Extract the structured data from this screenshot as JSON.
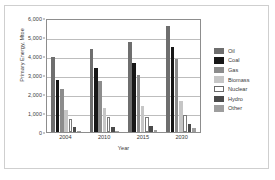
{
  "chart_data": {
    "type": "bar",
    "title": "",
    "xlabel": "Year",
    "ylabel": "Primary Energy, Mtoe",
    "categories": [
      "2004",
      "2010",
      "2015",
      "2030"
    ],
    "ylim": [
      0,
      6000
    ],
    "yticks": [
      0,
      1000,
      2000,
      3000,
      4000,
      5000,
      6000
    ],
    "ytick_labels": [
      "0",
      "1,000",
      "2,000",
      "3,000",
      "4,000",
      "5,000",
      "6,000"
    ],
    "grid": true,
    "legend_position": "right",
    "series": [
      {
        "name": "Oil",
        "color": "#6e6e6e",
        "values": [
          3950,
          4380,
          4750,
          5600
        ]
      },
      {
        "name": "Coal",
        "color": "#171717",
        "values": [
          2750,
          3350,
          3650,
          4450
        ]
      },
      {
        "name": "Gas",
        "color": "#8c8c8c",
        "values": [
          2280,
          2700,
          3000,
          3850
        ]
      },
      {
        "name": "Biomass",
        "color": "#c6c6c6",
        "values": [
          1150,
          1270,
          1380,
          1620
        ]
      },
      {
        "name": "Nuclear",
        "color": "#ffffff",
        "values": [
          710,
          780,
          800,
          880
        ]
      },
      {
        "name": "Hydro",
        "color": "#4a4a4a",
        "values": [
          240,
          270,
          300,
          400
        ]
      },
      {
        "name": "Other",
        "color": "#9e9e9e",
        "values": [
          30,
          50,
          100,
          220
        ]
      }
    ]
  }
}
